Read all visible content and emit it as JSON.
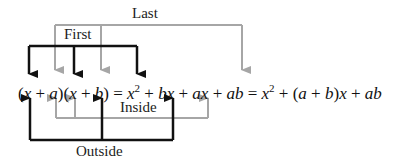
{
  "labels": {
    "last": "Last",
    "first": "First",
    "inside": "Inside",
    "outside": "Outside"
  },
  "equation": {
    "lhs": "(x + a)(x + b)",
    "expanded": "x² + bx + ax + ab",
    "simplified": "x² + (a + b)x + ab"
  },
  "colors": {
    "dark_arrow": "#111111",
    "gray_arrow": "#a6a6a6",
    "text": "#222222"
  }
}
